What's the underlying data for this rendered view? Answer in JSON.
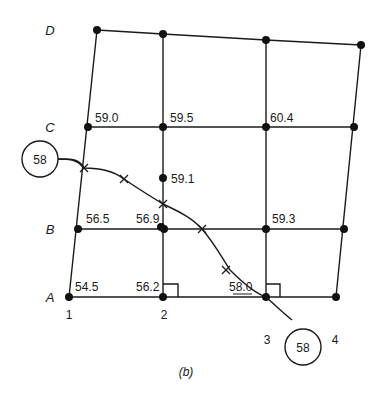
{
  "figure": {
    "caption": "(b)",
    "row_labels": [
      "A",
      "B",
      "C",
      "D"
    ],
    "column_labels": [
      "1",
      "2",
      "3",
      "4"
    ],
    "elevations": {
      "A1": "54.5",
      "A2": "56.2",
      "A3": "58.0",
      "B1": "56.5",
      "B2": "56.9",
      "B3": "59.3",
      "C1": "59.0",
      "C2": "59.5",
      "C3": "60.4",
      "mid_2_BC": "59.1"
    },
    "contour": {
      "value_left": "58",
      "value_right": "58"
    }
  }
}
